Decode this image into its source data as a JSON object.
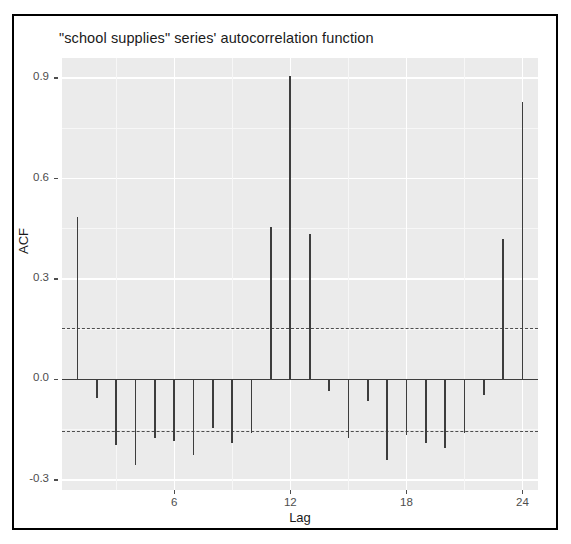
{
  "figure": {
    "title": "\"school supplies\" series' autocorrelation function",
    "border_color": "#000000",
    "panel_color": "#ebebeb",
    "grid_color": "#ffffff",
    "bar_color": "#3d3d3d",
    "conf_color": "#4d4d4d"
  },
  "axes": {
    "ylabel": "ACF",
    "xlabel": "Lag",
    "yticks": [
      "0.9",
      "0.6",
      "0.3",
      "0.0",
      "-0.3"
    ],
    "ytick_values": [
      0.9,
      0.6,
      0.3,
      0.0,
      -0.3
    ],
    "xticks": [
      "6",
      "12",
      "18",
      "24"
    ],
    "xtick_values": [
      6,
      12,
      18,
      24
    ]
  },
  "chart_data": {
    "type": "bar",
    "title": "\"school supplies\" series' autocorrelation function",
    "xlabel": "Lag",
    "ylabel": "ACF",
    "xlim": [
      0.2,
      24.8
    ],
    "ylim": [
      -0.33,
      0.96
    ],
    "grid": true,
    "legend": "none",
    "categories": [
      1,
      2,
      3,
      4,
      5,
      6,
      7,
      8,
      9,
      10,
      11,
      12,
      13,
      14,
      15,
      16,
      17,
      18,
      19,
      20,
      21,
      22,
      23,
      24
    ],
    "values": [
      0.485,
      -0.055,
      -0.195,
      -0.255,
      -0.175,
      -0.185,
      -0.225,
      -0.145,
      -0.19,
      -0.16,
      0.455,
      0.905,
      0.435,
      -0.035,
      -0.175,
      -0.065,
      -0.24,
      -0.165,
      -0.19,
      -0.205,
      -0.16,
      -0.045,
      0.42,
      0.83
    ],
    "annotations": [
      {
        "label": "upper confidence bound",
        "y": 0.155,
        "style": "dashed"
      },
      {
        "label": "lower confidence bound",
        "y": -0.155,
        "style": "dashed"
      },
      {
        "label": "zero line",
        "y": 0.0,
        "style": "solid"
      }
    ]
  }
}
